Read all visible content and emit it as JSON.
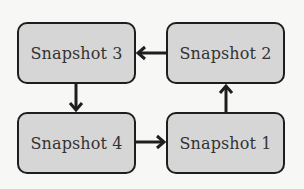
{
  "diagram": {
    "nodes": [
      {
        "id": "snapshot-3",
        "label": "Snapshot 3"
      },
      {
        "id": "snapshot-2",
        "label": "Snapshot 2"
      },
      {
        "id": "snapshot-4",
        "label": "Snapshot 4"
      },
      {
        "id": "snapshot-1",
        "label": "Snapshot 1"
      }
    ],
    "edges": [
      {
        "from": "Snapshot 2",
        "to": "Snapshot 3"
      },
      {
        "from": "Snapshot 3",
        "to": "Snapshot 4"
      },
      {
        "from": "Snapshot 4",
        "to": "Snapshot 1"
      },
      {
        "from": "Snapshot 1",
        "to": "Snapshot 2"
      }
    ],
    "colors": {
      "node_fill": "#d6d6d6",
      "node_border": "#1e1e1e",
      "arrow": "#1e1e1e",
      "background": "#f7f7f5"
    }
  }
}
